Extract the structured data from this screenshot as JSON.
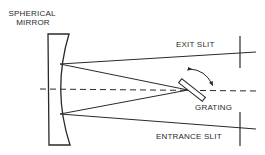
{
  "diagram": {
    "type": "spectrometer-optical-layout",
    "labels": {
      "mirror_line1": "SPHERICAL",
      "mirror_line2": "MIRROR",
      "exit_slit": "EXIT SLIT",
      "grating": "GRATING",
      "entrance_slit": "ENTRANCE SLIT"
    },
    "colors": {
      "ink": "#2a2a2a",
      "background": "#ffffff"
    },
    "components": [
      {
        "name": "spherical-mirror",
        "kind": "concave mirror"
      },
      {
        "name": "grating",
        "kind": "rotatable diffraction grating"
      },
      {
        "name": "exit-slit",
        "kind": "slit"
      },
      {
        "name": "entrance-slit",
        "kind": "slit"
      },
      {
        "name": "optical-axis",
        "kind": "dashed line"
      }
    ]
  }
}
